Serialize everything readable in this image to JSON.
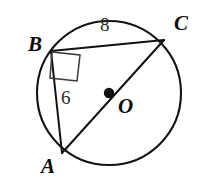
{
  "figure": {
    "type": "circle-geometry-diagram",
    "stroke_color": "#111111",
    "background_color": "#ffffff",
    "circle": {
      "cx": 109,
      "cy": 93,
      "r": 72,
      "stroke_width": 2.1
    },
    "center_dot": {
      "cx": 109,
      "cy": 93,
      "r": 5.2,
      "fill": "#111111"
    },
    "points": {
      "A": {
        "x": 62,
        "y": 153
      },
      "B": {
        "x": 51,
        "y": 51
      },
      "C": {
        "x": 164,
        "y": 40
      }
    },
    "segments": [
      {
        "name": "BC",
        "from": "B",
        "to": "C",
        "stroke_width": 2.0
      },
      {
        "name": "AB",
        "from": "B",
        "to": "A",
        "stroke_width": 2.0
      },
      {
        "name": "AC",
        "from": "A",
        "to": "C",
        "stroke_width": 2.0
      }
    ],
    "right_angle_marker": {
      "at": "B",
      "points": "52,52 80,55 77,81 50,78",
      "stroke_width": 1.5
    }
  },
  "labels": {
    "point_a": "A",
    "point_b": "B",
    "point_c": "C",
    "center_o": "O",
    "side_bc_length": "8",
    "side_ab_length": "6"
  }
}
